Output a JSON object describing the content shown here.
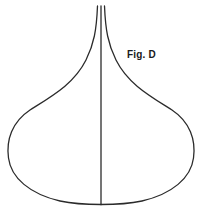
{
  "figure": {
    "label": "Fig. D",
    "background_color": "#ffffff",
    "stroke_color": "#2b2b2b",
    "stroke_width": 1.3,
    "canvas": {
      "width": 202,
      "height": 216
    },
    "label_position": {
      "x": 127,
      "y": 49
    },
    "geometry": {
      "neck_top_y": 6,
      "neck_left_x": 97,
      "neck_right_x": 105,
      "center_axis_x": 101,
      "body_left_extreme": {
        "x": 8,
        "y": 158
      },
      "body_right_extreme": {
        "x": 194,
        "y": 158
      },
      "base_y": 204
    },
    "paths": {
      "outline_left": "M 97.5,6 C 96.5,30 94,44 86,60 C 74,84 52,96 30,110 C 12,122 6,140 8.5,158 C 11,178 30,194 60,201 C 74,204 88,204.5 101,204.5",
      "outline_right": "M 104.5,6 C 105.5,30 108,44 116,60 C 128,84 150,96 172,110 C 190,122 196,140 193.5,158 C 191,178 172,194 142,201 C 128,204 114,204.5 101,204.5",
      "center_axis": "M 101,6 L 101,204.5"
    }
  }
}
